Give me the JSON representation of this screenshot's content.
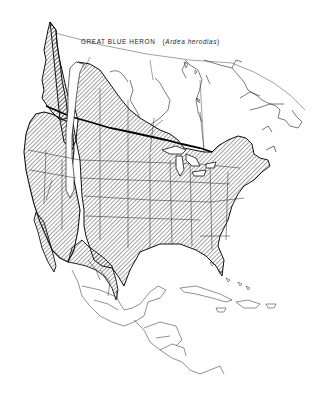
{
  "map": {
    "title": {
      "common_name": "GREAT BLUE HERON",
      "scientific_name": "Ardea herodias",
      "open_paren": "(",
      "close_paren": ")"
    },
    "region": "North America, Central America and Caribbean",
    "legend": {
      "hatched_area": "range",
      "heavy_line": "breeding range northern limit"
    },
    "colors": {
      "background": "#ffffff",
      "ink": "#111111",
      "hatch": "#333333"
    }
  }
}
